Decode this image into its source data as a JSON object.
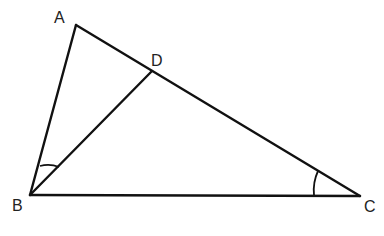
{
  "diagram": {
    "type": "geometry-triangle",
    "vertices": {
      "A": {
        "label": "A",
        "x": 76,
        "y": 25
      },
      "B": {
        "label": "B",
        "x": 30,
        "y": 195
      },
      "C": {
        "label": "C",
        "x": 360,
        "y": 196
      },
      "D": {
        "label": "D",
        "x": 152,
        "y": 71
      }
    },
    "segments": [
      "AB",
      "AC",
      "BC",
      "BD"
    ],
    "marked_angles": [
      "ABD",
      "ACB"
    ],
    "labels": {
      "A": "A",
      "B": "B",
      "C": "C",
      "D": "D"
    },
    "colors": {
      "stroke": "#111111",
      "background": "#ffffff"
    }
  }
}
